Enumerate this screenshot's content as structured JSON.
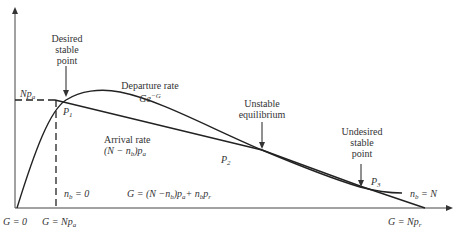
{
  "diagram": {
    "type": "slotted-aloha-stability",
    "annotations": {
      "desired": [
        "Desired",
        "stable",
        "point"
      ],
      "unstable": [
        "Unstable",
        "equilibrium"
      ],
      "undesired": [
        "Undesired",
        "stable",
        "point"
      ],
      "departure_title": "Departure rate",
      "departure_formula": "Ge",
      "departure_exp": "−G",
      "arrival_title": "Arrival rate",
      "arrival_formula_pre": "(N − n",
      "arrival_formula_sub": "b",
      "arrival_formula_post": ")p",
      "arrival_formula_sub2": "a"
    },
    "points": {
      "p1": "P",
      "p1_sub": "1",
      "p2": "P",
      "p2_sub": "2",
      "p3": "P",
      "p3_sub": "3"
    },
    "yaxis": {
      "np_a": "Np",
      "np_a_sub": "a"
    },
    "region_labels": {
      "nb0_pre": "n",
      "nb0_sub": "b",
      "nb0_post": " = 0",
      "nbN_pre": "n",
      "nbN_sub": "b",
      "nbN_post": " = N",
      "g_eq_pre": "G = (N −n",
      "g_eq_sub1": "b",
      "g_eq_mid": ")p",
      "g_eq_sub2": "a",
      "g_eq_mid2": "+ n",
      "g_eq_sub3": "b",
      "g_eq_mid3": "p",
      "g_eq_sub4": "r"
    },
    "xaxis": {
      "g0": "G = 0",
      "g_npa_pre": "G = Np",
      "g_npa_sub": "a",
      "g_npr_pre": "G = Np",
      "g_npr_sub": "r"
    },
    "colors": {
      "line": "#222222",
      "text": "#333333"
    }
  }
}
